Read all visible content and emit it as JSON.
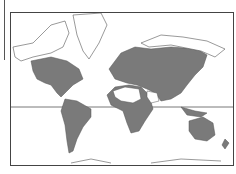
{
  "map": {
    "title": "World distribution map",
    "projection": "Mercator",
    "colors": {
      "range_fill": "#7a7a7a",
      "land_outline": "#555555",
      "background": "#ffffff",
      "frame": "#444444"
    },
    "regions_shaded": [
      "North America",
      "Central America",
      "South America",
      "Europe",
      "Asia",
      "Africa (excluding Sahara and Arabia)",
      "Southeast Asia",
      "Australia",
      "New Zealand"
    ],
    "regions_unshaded": [
      "Greenland",
      "Arctic Canada",
      "Alaska",
      "Sahara",
      "Arabian Peninsula",
      "Antarctica",
      "Siberian Arctic"
    ],
    "equator_line": true
  }
}
